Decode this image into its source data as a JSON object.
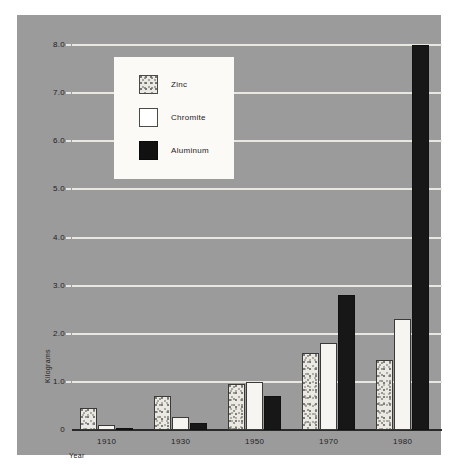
{
  "chart_data": {
    "type": "bar",
    "title": "",
    "subtitle": "",
    "xlabel": "Year",
    "ylabel": "Kilograms",
    "categories": [
      "1910",
      "1930",
      "1950",
      "1970",
      "1980"
    ],
    "series": [
      {
        "name": "Zinc",
        "values": [
          0.45,
          0.7,
          0.95,
          1.6,
          1.45
        ],
        "color": "#ebe9e4",
        "pattern": "stippled"
      },
      {
        "name": "Chromite",
        "values": [
          0.1,
          0.27,
          1.0,
          1.8,
          2.3
        ],
        "color": "#f6f5f1",
        "pattern": "solid-white"
      },
      {
        "name": "Aluminum",
        "values": [
          0.05,
          0.15,
          0.7,
          2.8,
          8.0
        ],
        "color": "#171717",
        "pattern": "solid-black"
      }
    ],
    "ylim": [
      0,
      8.0
    ],
    "ytick_labels": [
      "0",
      "1.0",
      "2.0",
      "3.0",
      "4.0",
      "5.0",
      "6.0",
      "7.0",
      "8.0"
    ],
    "ytick_values": [
      0,
      1.0,
      2.0,
      3.0,
      4.0,
      5.0,
      6.0,
      7.0,
      8.0
    ],
    "grid": true,
    "grid_axis": "y",
    "legend_position": "upper-left-inset",
    "background_color": "#9b9b9b",
    "gridline_color": "#e9e7e2",
    "axis_color": "#2a2a2a"
  },
  "legend": {
    "entries": [
      {
        "label": "Zinc"
      },
      {
        "label": "Chromite"
      },
      {
        "label": "Aluminum"
      }
    ]
  },
  "axes": {
    "y_axis_title": "Kilograms",
    "x_axis_title": "Year"
  }
}
